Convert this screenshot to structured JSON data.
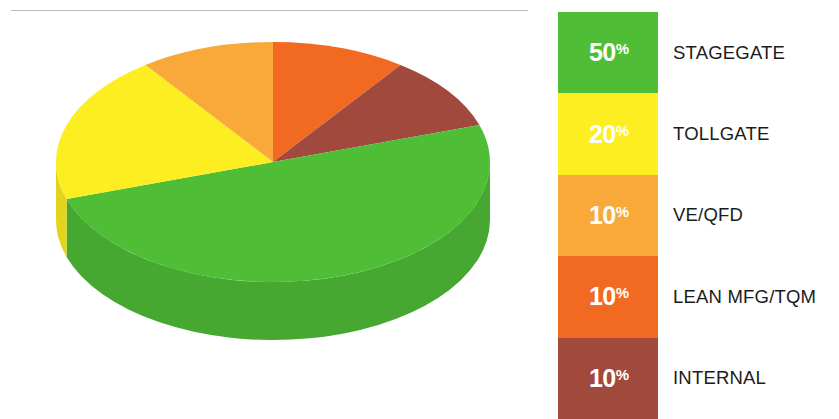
{
  "chart_data": {
    "type": "pie",
    "title": "",
    "subtitle": "",
    "xlabel": "",
    "ylabel": "",
    "style": "3d-pie",
    "legend_position": "right",
    "grid": false,
    "value_unit": "%",
    "categories": [
      "STAGEGATE",
      "TOLLGATE",
      "VE/QFD",
      "LEAN MFG/TQM",
      "INTERNAL"
    ],
    "values": [
      50,
      20,
      10,
      10,
      10
    ],
    "colors": [
      "#4FBE36",
      "#FDEE21",
      "#F8A93A",
      "#F26A21",
      "#A0493C"
    ],
    "slices": [
      {
        "label": "STAGEGATE",
        "value": 50,
        "value_text": "50",
        "unit": "%",
        "color": "#4FBE36",
        "side_color": "#46A830",
        "start_angle": 90,
        "end_angle": 270
      },
      {
        "label": "TOLLGATE",
        "value": 20,
        "value_text": "20",
        "unit": "%",
        "color": "#FDEE21",
        "side_color": "#E2D41C",
        "start_angle": 270,
        "end_angle": 342
      },
      {
        "label": "VE/QFD",
        "value": 10,
        "value_text": "10",
        "unit": "%",
        "color": "#F8A93A",
        "side_color": "#DE9530",
        "start_angle": 342,
        "end_angle": 378
      },
      {
        "label": "LEAN MFG/TQM",
        "value": 10,
        "value_text": "10",
        "unit": "%",
        "color": "#F26A21",
        "side_color": "#D85B1A",
        "start_angle": 18,
        "end_angle": 54
      },
      {
        "label": "INTERNAL",
        "value": 10,
        "value_text": "10",
        "unit": "%",
        "color": "#A0493C",
        "side_color": "#8C3D32",
        "start_angle": 54,
        "end_angle": 90
      }
    ]
  },
  "legend": {
    "rows": [
      {
        "percent": "50",
        "symbol": "%",
        "label": "STAGEGATE",
        "color": "#4FBE36"
      },
      {
        "percent": "20",
        "symbol": "%",
        "label": "TOLLGATE",
        "color": "#FDEE21"
      },
      {
        "percent": "10",
        "symbol": "%",
        "label": "VE/QFD",
        "color": "#F8A93A"
      },
      {
        "percent": "10",
        "symbol": "%",
        "label": "LEAN MFG/TQM",
        "color": "#F26A21"
      },
      {
        "percent": "10",
        "symbol": "%",
        "label": "INTERNAL",
        "color": "#A0493C"
      }
    ]
  },
  "divider": {
    "color": "#b9b9b9"
  }
}
